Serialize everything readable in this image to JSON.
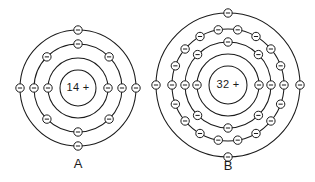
{
  "figure": {
    "type": "bohr-atomic-model-diagram",
    "background_color": "#ffffff",
    "stroke_color": "#1a1a1a",
    "width": 315,
    "height": 182
  },
  "atoms": [
    {
      "id": "atom-a",
      "label": "A",
      "nucleus_charge_text": "14 +",
      "nucleus_number": "14",
      "nucleus_sign": "+",
      "center_x": 78,
      "center_y": 88,
      "nucleus_radius": 18,
      "label_x": 78,
      "label_y": 165,
      "electron_total": 14,
      "shells": [
        {
          "index": 1,
          "radius": 30,
          "electron_count": 2,
          "start_angle": 180
        },
        {
          "index": 2,
          "radius": 44,
          "electron_count": 8,
          "start_angle": 180
        },
        {
          "index": 3,
          "radius": 58,
          "electron_count": 4,
          "start_angle": 180
        }
      ]
    },
    {
      "id": "atom-b",
      "label": "B",
      "nucleus_charge_text": "32 +",
      "nucleus_number": "32",
      "nucleus_sign": "+",
      "center_x": 228,
      "center_y": 85,
      "nucleus_radius": 19,
      "label_x": 228,
      "label_y": 167,
      "electron_total": 32,
      "shells": [
        {
          "index": 1,
          "radius": 31,
          "electron_count": 2,
          "start_angle": 180
        },
        {
          "index": 2,
          "radius": 43,
          "electron_count": 8,
          "start_angle": 180
        },
        {
          "index": 3,
          "radius": 56,
          "electron_count": 18,
          "start_angle": 180
        },
        {
          "index": 4,
          "radius": 72,
          "electron_count": 4,
          "start_angle": 180
        }
      ]
    }
  ],
  "electron_glyph": {
    "name": "electron-minus-circle",
    "radius": 4.2,
    "sign_half_width": 2.1
  },
  "chart_data": {
    "type": "diagram",
    "title": "",
    "series": [
      {
        "name": "A",
        "nucleus_charge": 14,
        "shell_occupancy": [
          2,
          8,
          4
        ],
        "shell_count": 3,
        "electron_total": 14
      },
      {
        "name": "B",
        "nucleus_charge": 32,
        "shell_occupancy": [
          2,
          8,
          18,
          4
        ],
        "shell_count": 4,
        "electron_total": 32
      }
    ]
  }
}
